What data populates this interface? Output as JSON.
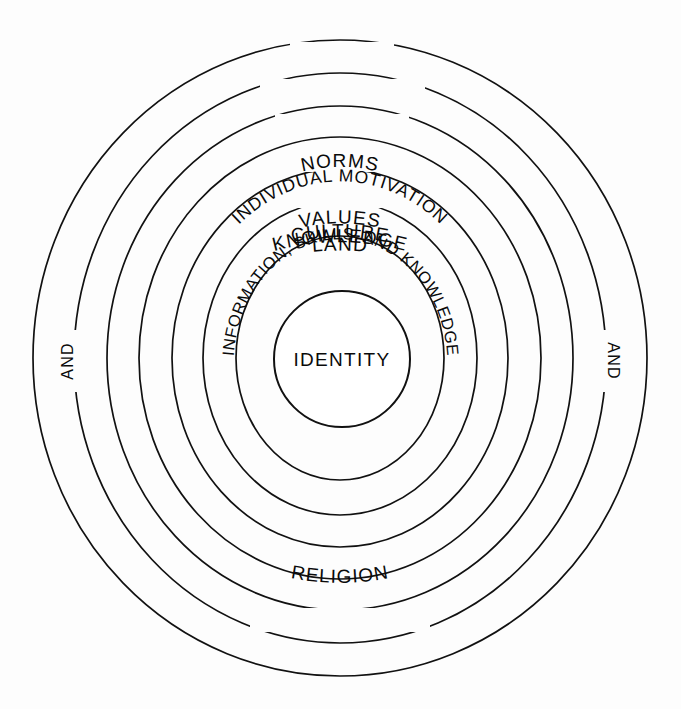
{
  "diagram": {
    "type": "concentric-rings",
    "stroke_color": "#111111",
    "background_color": "#fdfdfd",
    "center": {
      "label": "IDENTITY"
    },
    "rings": [
      {
        "index": 1,
        "label": "LAND",
        "position": "top",
        "rx": 307,
        "ry": 318
      },
      {
        "index": 2,
        "label": "KNOWLEDGE",
        "position": "top",
        "rx": 266,
        "ry": 285
      },
      {
        "index": 3,
        "label": "CULTURE",
        "position": "top",
        "rx": 233,
        "ry": 252
      },
      {
        "index": 4,
        "label": "VALUES",
        "position": "top",
        "rx": 201,
        "ry": 221
      },
      {
        "index": 5,
        "label": "NORMS",
        "position": "top",
        "rx": 168,
        "ry": 189
      },
      {
        "index": 6,
        "label": "INDIVIDUAL  MOTIVATION",
        "position": "top-arc",
        "rx": 137,
        "ry": 157
      },
      {
        "index": 7,
        "label": "INFORMATION, SKILLS, AND KNOWLEDGE",
        "position": "full-arc",
        "rx": 104,
        "ry": 122
      }
    ],
    "side_labels": [
      {
        "text": "AND",
        "position": "left",
        "rotation": -90
      },
      {
        "text": "AND",
        "position": "right",
        "rotation": 90
      }
    ],
    "bottom_labels": [
      {
        "text": "RELIGION",
        "position": "bottom",
        "ring_index": 2
      }
    ]
  }
}
